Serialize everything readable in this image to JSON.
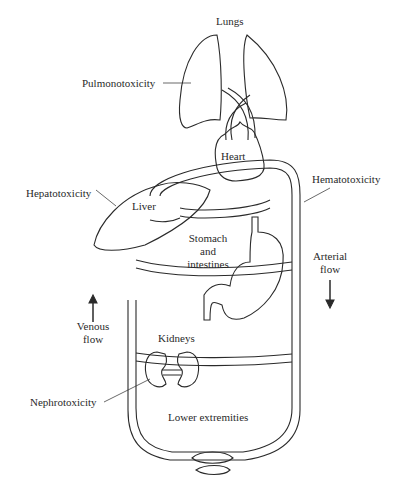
{
  "diagram": {
    "organs": {
      "lungs": "Lungs",
      "heart": "Heart",
      "liver": "Liver",
      "stomach_line1": "Stomach",
      "stomach_line2": "and",
      "stomach_line3": "intestines",
      "kidneys": "Kidneys",
      "lower": "Lower extremities"
    },
    "toxicities": {
      "pulmonary": "Pulmonotoxicity",
      "hepatic": "Hepatotoxicity",
      "hemato": "Hematotoxicity",
      "nephro": "Nephrotoxicity"
    },
    "flows": {
      "arterial_line1": "Arterial",
      "arterial_line2": "flow",
      "venous_line1": "Venous",
      "venous_line2": "flow"
    },
    "colors": {
      "stroke": "#2a2a2a",
      "background": "#ffffff"
    }
  }
}
